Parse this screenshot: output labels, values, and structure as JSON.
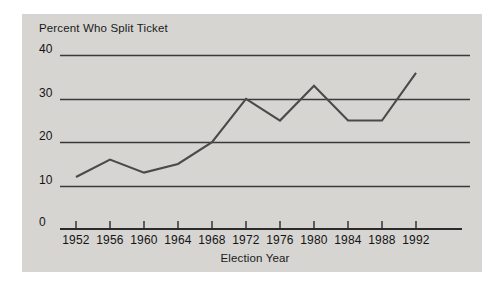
{
  "chart_data": {
    "type": "line",
    "title": "Percent Who Split Ticket",
    "xlabel": "Election Year",
    "ylabel": "",
    "categories": [
      "1952",
      "1956",
      "1960",
      "1964",
      "1968",
      "1972",
      "1976",
      "1980",
      "1984",
      "1988",
      "1992"
    ],
    "values": [
      12,
      16,
      13,
      15,
      20,
      30,
      25,
      33,
      25,
      25,
      36
    ],
    "series": [
      {
        "name": "Percent Who Split Ticket",
        "values": [
          12,
          16,
          13,
          15,
          20,
          30,
          25,
          33,
          25,
          25,
          36
        ]
      }
    ],
    "xlim": [
      1952,
      1992
    ],
    "ylim": [
      0,
      40
    ],
    "yticks": [
      "0",
      "10",
      "20",
      "30",
      "40"
    ],
    "ytick_values": [
      0,
      10,
      20,
      30,
      40
    ],
    "grid": true,
    "legend": false,
    "line_color": "#4a4a4a",
    "grid_color": "#3a3a3a",
    "background_color": "#d6d5d2"
  }
}
